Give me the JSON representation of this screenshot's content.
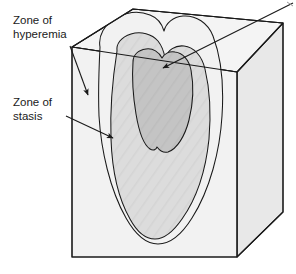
{
  "figure": {
    "type": "medical-diagram",
    "background_color": "#ffffff"
  },
  "labels": {
    "hyperemia": {
      "line1": "Zone of",
      "line2": "hyperemia",
      "target_zone": "outer-zone"
    },
    "stasis": {
      "line1": "Zone of",
      "line2": "stasis",
      "target_zone": "middle-zone"
    },
    "coagulation": {
      "line1": "",
      "line2": "",
      "target_zone": "inner-zone",
      "note": "label text runs off the top-right edge of the image"
    }
  },
  "block": {
    "name": "tissue-block",
    "front_face_color": "#f2f2f2",
    "side_face_color": "#e8e8e8",
    "top_face_color": "#f4f4f4",
    "outline_color": "#1a1a1a",
    "outline_width": 1.1
  },
  "zones": [
    {
      "id": "outer-zone",
      "name": "zone-of-hyperemia",
      "fill": "#f2f2f2",
      "order": 1
    },
    {
      "id": "middle-zone",
      "name": "zone-of-stasis",
      "fill": "#dcdcdc",
      "order": 2
    },
    {
      "id": "inner-zone",
      "name": "zone-of-coagulation",
      "fill": "#c4c4c4",
      "order": 3
    }
  ],
  "arrows": [
    {
      "id": "arrow-hyperemia",
      "from": [
        70,
        46
      ],
      "to": [
        89,
        96
      ],
      "color": "#1a1a1a"
    },
    {
      "id": "arrow-stasis",
      "from": [
        66,
        116
      ],
      "to": [
        114,
        139
      ],
      "color": "#1a1a1a"
    },
    {
      "id": "arrow-coagulation",
      "from": [
        290,
        5
      ],
      "to": [
        163,
        69
      ],
      "color": "#1a1a1a"
    }
  ]
}
